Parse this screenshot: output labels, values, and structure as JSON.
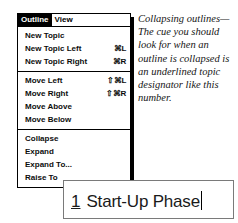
{
  "menu": {
    "menubar": [
      {
        "label": "Outline",
        "selected": true
      },
      {
        "label": "View",
        "selected": false
      }
    ],
    "groups": [
      {
        "items": [
          {
            "label": "New Topic",
            "shortcut": ""
          },
          {
            "label": "New Topic Left",
            "shortcut": "⌘L"
          },
          {
            "label": "New Topic Right",
            "shortcut": "⌘R"
          }
        ]
      },
      {
        "items": [
          {
            "label": "Move Left",
            "shortcut": "⇧⌘L"
          },
          {
            "label": "Move Right",
            "shortcut": "⇧⌘R"
          },
          {
            "label": "Move Above",
            "shortcut": ""
          },
          {
            "label": "Move Below",
            "shortcut": ""
          }
        ]
      },
      {
        "items": [
          {
            "label": "Collapse",
            "shortcut": ""
          },
          {
            "label": "Expand",
            "shortcut": ""
          },
          {
            "label": "Expand To...",
            "shortcut": ""
          },
          {
            "label": "Raise To",
            "shortcut": ""
          }
        ]
      }
    ]
  },
  "annotation": {
    "text": "Collapsing outlines—The cue you should look for when an outline is collapsed is an underlined topic designator like this number."
  },
  "textbox": {
    "designator": "1",
    "value": "Start-Up Phase"
  },
  "colors": {
    "ink": "#000000",
    "highlight_bg": "#000000",
    "highlight_fg": "#ffffff",
    "box_border": "#7a7a7a",
    "leader_line": "#4a4a4a"
  }
}
